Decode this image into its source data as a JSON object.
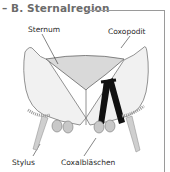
{
  "title": "– B. Sternalregion",
  "labels": {
    "sternum": "Sternum",
    "coxopodit": "Coxopodit",
    "stylus": "Stylus",
    "coxalblaeschen": "Coxalbläschen"
  },
  "colors": {
    "title": "#6b6b6b",
    "frame": "#9a9a9a",
    "plate_fill": "#eeeeee",
    "sternum_fill": "#d8d8d8",
    "muscle": "#111111"
  }
}
